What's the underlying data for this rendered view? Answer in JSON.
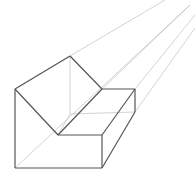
{
  "diagram": {
    "colors": {
      "background": "#ffffff",
      "edge": "#555555",
      "construction": "#b5b5b5"
    },
    "vanishing_lines": [
      {
        "x1": 70,
        "y1": 56,
        "x2": 165,
        "y2": 0
      },
      {
        "x1": 102,
        "y1": 89,
        "x2": 190,
        "y2": 5
      },
      {
        "x1": 135,
        "y1": 89,
        "x2": 195,
        "y2": 15
      },
      {
        "x1": 135,
        "y1": 112,
        "x2": 195,
        "y2": 28
      },
      {
        "x1": 15,
        "y1": 168,
        "x2": 190,
        "y2": 5
      }
    ],
    "hidden_edges": [
      {
        "x1": 70,
        "y1": 56,
        "x2": 70,
        "y2": 114
      },
      {
        "x1": 70,
        "y1": 114,
        "x2": 135,
        "y2": 112
      },
      {
        "x1": 58,
        "y1": 135,
        "x2": 70,
        "y2": 114
      }
    ],
    "visible_edges": [
      {
        "x1": 15,
        "y1": 89,
        "x2": 70,
        "y2": 56
      },
      {
        "x1": 70,
        "y1": 56,
        "x2": 102,
        "y2": 89
      },
      {
        "x1": 15,
        "y1": 89,
        "x2": 58,
        "y2": 135
      },
      {
        "x1": 15,
        "y1": 89,
        "x2": 15,
        "y2": 168
      },
      {
        "x1": 15,
        "y1": 168,
        "x2": 102,
        "y2": 168
      },
      {
        "x1": 58,
        "y1": 135,
        "x2": 102,
        "y2": 135
      },
      {
        "x1": 102,
        "y1": 135,
        "x2": 102,
        "y2": 168
      },
      {
        "x1": 102,
        "y1": 89,
        "x2": 135,
        "y2": 89
      },
      {
        "x1": 135,
        "y1": 89,
        "x2": 135,
        "y2": 112
      },
      {
        "x1": 58,
        "y1": 135,
        "x2": 102,
        "y2": 89
      },
      {
        "x1": 102,
        "y1": 135,
        "x2": 135,
        "y2": 89
      },
      {
        "x1": 102,
        "y1": 168,
        "x2": 135,
        "y2": 112
      }
    ]
  }
}
